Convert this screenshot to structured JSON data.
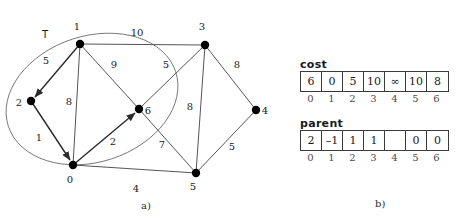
{
  "figure": {
    "panel_a": {
      "caption": "a)",
      "tree_label": "T",
      "nodes": [
        {
          "id": "0",
          "label": "0",
          "x": 73,
          "y": 165,
          "lx": 70,
          "ly": 183
        },
        {
          "id": "1",
          "label": "1",
          "x": 80,
          "y": 44,
          "lx": 77,
          "ly": 30
        },
        {
          "id": "2",
          "label": "2",
          "x": 31,
          "y": 101,
          "lx": 19,
          "ly": 106
        },
        {
          "id": "3",
          "label": "3",
          "x": 205,
          "y": 45,
          "lx": 202,
          "ly": 30
        },
        {
          "id": "4",
          "label": "4",
          "x": 256,
          "y": 110,
          "lx": 263,
          "ly": 115
        },
        {
          "id": "5",
          "label": "5",
          "x": 196,
          "y": 173,
          "lx": 193,
          "ly": 190
        },
        {
          "id": "6",
          "label": "6",
          "x": 139,
          "y": 109,
          "lx": 146,
          "ly": 114
        }
      ],
      "edges": [
        {
          "from": "1",
          "to": "2",
          "weight": "5",
          "directed": true,
          "wx": 46,
          "wy": 64
        },
        {
          "from": "1",
          "to": "0",
          "weight": "8",
          "directed": false,
          "wx": 69,
          "wy": 105
        },
        {
          "from": "1",
          "to": "6",
          "weight": "9",
          "directed": false,
          "wx": 114,
          "wy": 68
        },
        {
          "from": "1",
          "to": "3",
          "weight": "10",
          "directed": false,
          "wx": 137,
          "wy": 36
        },
        {
          "from": "2",
          "to": "0",
          "weight": "1",
          "directed": true,
          "wx": 39,
          "wy": 141
        },
        {
          "from": "0",
          "to": "6",
          "weight": "2",
          "directed": true,
          "wx": 113,
          "wy": 145
        },
        {
          "from": "0",
          "to": "5",
          "weight": "4",
          "directed": false,
          "wx": 136,
          "wy": 188
        },
        {
          "from": "3",
          "to": "6",
          "weight": "5",
          "directed": false,
          "wx": 166,
          "wy": 68
        },
        {
          "from": "3",
          "to": "5",
          "weight": "8",
          "directed": false,
          "wx": 190,
          "wy": 110
        },
        {
          "from": "3",
          "to": "4",
          "weight": "8",
          "directed": false,
          "wx": 237,
          "wy": 68
        },
        {
          "from": "6",
          "to": "5",
          "weight": "7",
          "directed": false,
          "wx": 162,
          "wy": 148
        },
        {
          "from": "4",
          "to": "5",
          "weight": "5",
          "directed": false,
          "wx": 232,
          "wy": 150
        }
      ]
    },
    "panel_b": {
      "caption": "b)",
      "cost": {
        "title": "cost",
        "values": [
          "6",
          "0",
          "5",
          "10",
          "∞",
          "10",
          "8"
        ],
        "indices": [
          "0",
          "1",
          "2",
          "3",
          "4",
          "5",
          "6"
        ]
      },
      "parent": {
        "title": "parent",
        "values": [
          "2",
          "–1",
          "1",
          "1",
          "",
          "0",
          "0"
        ],
        "indices": [
          "0",
          "1",
          "2",
          "3",
          "4",
          "5",
          "6"
        ]
      }
    }
  }
}
